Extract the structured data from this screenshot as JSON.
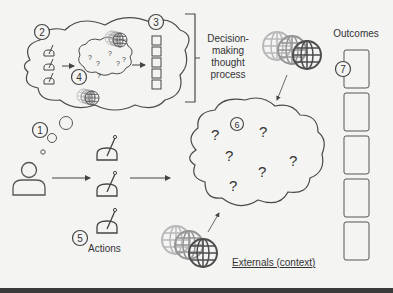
{
  "diagram": {
    "labels": {
      "decision_process": [
        "Decision-",
        "making",
        "thought",
        "process"
      ],
      "outcomes": "Outcomes",
      "actions": "Actions",
      "externals": "Externals (context)"
    },
    "markers": [
      "1",
      "2",
      "3",
      "4",
      "5",
      "6",
      "7"
    ],
    "question_mark": "?",
    "outcome_count": 5,
    "colors": {
      "stroke": "#4a4a4a",
      "text": "#333333",
      "globe_light": "#b5b5b5",
      "globe_mid": "#8c8c8c",
      "globe_dark": "#4d4d4d",
      "background": "#f4f4f3"
    }
  }
}
